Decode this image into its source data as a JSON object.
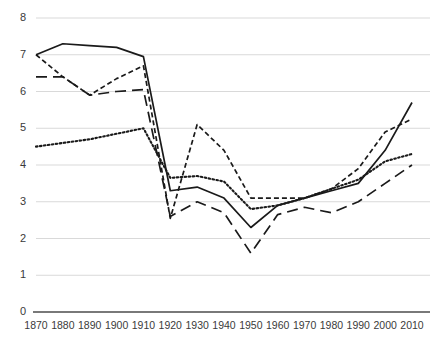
{
  "chart_data": {
    "type": "line",
    "title": "",
    "subtitle": "",
    "xlabel": "",
    "ylabel": "",
    "x": [
      1870,
      1880,
      1890,
      1900,
      1910,
      1920,
      1930,
      1940,
      1950,
      1960,
      1970,
      1980,
      1990,
      2000,
      2010
    ],
    "categories": [
      "1870",
      "1880",
      "1890",
      "1900",
      "1910",
      "1920",
      "1930",
      "1940",
      "1950",
      "1960",
      "1970",
      "1980",
      "1990",
      "2000",
      "2010"
    ],
    "xlim": [
      1870,
      2010
    ],
    "ylim": [
      0,
      8
    ],
    "yticks": [
      0,
      1,
      2,
      3,
      4,
      5,
      6,
      7,
      8
    ],
    "ytick_labels": [
      "0",
      "1",
      "2",
      "3",
      "4",
      "5",
      "6",
      "7",
      "8"
    ],
    "grid": true,
    "grid_axis": "y",
    "legend": "none",
    "series": [
      {
        "name": "series-solid",
        "style": "solid",
        "color": "#1a1a1a",
        "values": [
          7.0,
          7.3,
          7.25,
          7.2,
          6.95,
          3.3,
          3.4,
          3.1,
          2.3,
          2.9,
          3.1,
          3.3,
          3.5,
          4.4,
          5.7
        ]
      },
      {
        "name": "series-short-dash",
        "style": "short-dash",
        "color": "#1a1a1a",
        "values": [
          7.0,
          6.4,
          5.9,
          6.35,
          6.7,
          2.55,
          5.1,
          4.4,
          3.1,
          3.1,
          3.1,
          3.35,
          3.9,
          4.9,
          5.25
        ]
      },
      {
        "name": "series-dotted",
        "style": "dotted",
        "color": "#1a1a1a",
        "values": [
          4.5,
          4.6,
          4.7,
          4.85,
          5.0,
          3.65,
          3.7,
          3.55,
          2.8,
          2.9,
          3.1,
          3.35,
          3.6,
          4.1,
          4.3
        ]
      },
      {
        "name": "series-long-dash",
        "style": "long-dash",
        "color": "#1a1a1a",
        "values": [
          6.4,
          6.4,
          5.9,
          6.0,
          6.05,
          2.6,
          3.0,
          2.7,
          1.6,
          2.65,
          2.85,
          2.7,
          3.0,
          3.5,
          4.0
        ]
      }
    ],
    "axis_color": "#4d4d4d",
    "grid_color": "#d9d9d9"
  }
}
